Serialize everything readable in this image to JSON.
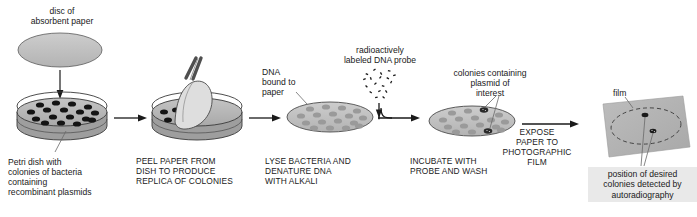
{
  "diagram": {
    "background": "#ffffff",
    "ink": "#1a1a1a",
    "dish_fill": "#b9b9b9",
    "paper_fill": "#c6c6c6",
    "colony_dark": "#1a1a1a",
    "colony_light": "#9a9a9a",
    "film_fill": "#b5b5b5",
    "caption_box_fill": "#e9e9e9"
  },
  "labels": {
    "disc_of_absorbent_paper": "disc of\nabsorbent paper",
    "petri_dish_caption": "Petri dish with\ncolonies of bacteria\ncontaining\nrecombinant plasmids",
    "peel_paper": "PEEL PAPER FROM\nDISH TO PRODUCE\nREPLICA OF COLONIES",
    "dna_bound_to_paper": "DNA\nbound to\npaper",
    "lyse_bacteria": "LYSE BACTERIA AND\nDENATURE DNA\nWITH ALKALI",
    "radioactive_probe": "radioactively\nlabeled DNA probe",
    "colonies_containing_plasmid": "colonies containing\nplasmid of\ninterest",
    "incubate_with_probe": "INCUBATE WITH\nPROBE AND WASH",
    "expose_paper": "EXPOSE\nPAPER TO\nPHOTOGRAPHIC\nFILM",
    "film": "film",
    "position_of_desired": "position of desired\ncolonies detected by\nautoradiography"
  },
  "steps": [
    {
      "id": "step-1",
      "name": "absorbent-paper-disc",
      "caption": "disc of absorbent paper"
    },
    {
      "id": "step-2",
      "name": "petri-dish-colonies",
      "caption": "Petri dish with colonies of bacteria containing recombinant plasmids",
      "colony_count": 17
    },
    {
      "id": "step-3",
      "name": "peel-paper-replica",
      "caption": "PEEL PAPER FROM DISH TO PRODUCE REPLICA OF COLONIES"
    },
    {
      "id": "step-4",
      "name": "lyse-denature-disc",
      "caption": "LYSE BACTERIA AND DENATURE DNA WITH ALKALI",
      "spot_count": 17
    },
    {
      "id": "step-5",
      "name": "incubate-probe-disc",
      "caption": "INCUBATE WITH PROBE AND WASH",
      "spot_count": 17,
      "positive_count": 2
    },
    {
      "id": "step-6",
      "name": "autoradiograph-film",
      "caption": "EXPOSE PAPER TO PHOTOGRAPHIC FILM",
      "detected_spots": 2
    }
  ],
  "arrows": [
    {
      "name": "arrow-disc-to-dish",
      "direction": "down"
    },
    {
      "name": "arrow-dish-to-peel",
      "direction": "right"
    },
    {
      "name": "arrow-peel-to-lyse",
      "direction": "right"
    },
    {
      "name": "arrow-probe-down",
      "direction": "down"
    },
    {
      "name": "arrow-lyse-to-incubate",
      "direction": "right"
    },
    {
      "name": "arrow-incubate-to-film",
      "direction": "right"
    }
  ]
}
